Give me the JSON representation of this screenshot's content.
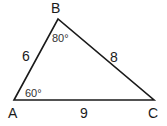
{
  "diagram": {
    "type": "triangle",
    "vertices": [
      {
        "name": "A",
        "label": "A"
      },
      {
        "name": "B",
        "label": "B"
      },
      {
        "name": "C",
        "label": "C"
      }
    ],
    "sides": {
      "AB": "6",
      "BC": "8",
      "AC": "9"
    },
    "angles": {
      "A": "60°",
      "B": "80°"
    },
    "colors": {
      "stroke": "#1a1a1a",
      "text": "#1a1a1a",
      "background": "#ffffff"
    }
  }
}
